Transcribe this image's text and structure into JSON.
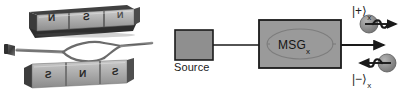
{
  "figure": {
    "background_color": "#ffffff",
    "width": 419,
    "height": 94,
    "panels": [
      {
        "id": "photo",
        "kind": "photograph",
        "caption_text": ""
      },
      {
        "id": "schematic",
        "kind": "block-diagram",
        "caption_text": ""
      }
    ]
  },
  "photo": {
    "description_text": "",
    "top_magnet": {
      "pole_labels": [
        "N",
        "S",
        "N"
      ],
      "mirrored": "true",
      "body_color": "#b9b9b9",
      "edge_color": "#2f2f2f"
    },
    "bottom_magnet": {
      "pole_labels": [
        "S",
        "N",
        "S"
      ],
      "mirrored": "true",
      "body_color": "#b0b0b0",
      "edge_color": "#2f2f2f"
    },
    "fiber": {
      "component_name": "mach-zehnder-fiber-interferometer",
      "connector_label": "",
      "fiber_color": "#6e6e6e"
    }
  },
  "schematic": {
    "source_block": {
      "label": "Source",
      "fill_color": "#8f8f8f",
      "border_color": "#1a1a1a"
    },
    "msg_block": {
      "label": "MSG",
      "subscript": "x",
      "fill_color": "#9a9a9a",
      "border_color": "#1a1a1a",
      "inner_shape": "ellipse-interferometer"
    },
    "link_arrow": {
      "label": "",
      "color": "#1a1a1a"
    },
    "outputs": [
      {
        "ket": "|+⟩",
        "subscript": "x",
        "spin_direction": "right",
        "sphere_color": "#8c8c8c",
        "arrow_color": "#1a1a1a"
      },
      {
        "ket": "|−⟩",
        "subscript": "x",
        "spin_direction": "left",
        "sphere_color": "#8c8c8c",
        "arrow_color": "#1a1a1a"
      }
    ]
  },
  "colors": {
    "ink": "#1a1a1a",
    "metal_light": "#c4c4c4",
    "metal_mid": "#9a9a9a",
    "metal_dark": "#4a4a4a",
    "paper": "#ffffff"
  }
}
